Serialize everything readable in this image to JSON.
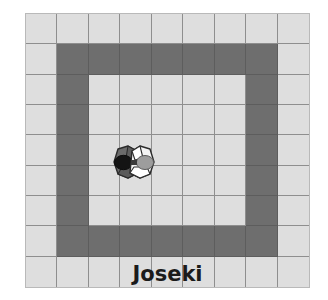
{
  "illustration": {
    "title": "Joseki",
    "caption": "Joseki"
  },
  "board": {
    "columns": 9,
    "rows": 9,
    "light_color": "#dedede",
    "dark_color": "#6e6e6e",
    "line_color": "#8e8e8e",
    "border_color": "#b9b9b9",
    "grid": [
      [
        "light",
        "light",
        "light",
        "light",
        "light",
        "light",
        "light",
        "light",
        "light"
      ],
      [
        "light",
        "dark",
        "dark",
        "dark",
        "dark",
        "dark",
        "dark",
        "dark",
        "light"
      ],
      [
        "light",
        "dark",
        "light",
        "light",
        "light",
        "light",
        "light",
        "dark",
        "light"
      ],
      [
        "light",
        "dark",
        "light",
        "light",
        "light",
        "light",
        "light",
        "dark",
        "light"
      ],
      [
        "light",
        "dark",
        "light",
        "light",
        "light",
        "light",
        "light",
        "dark",
        "light"
      ],
      [
        "light",
        "dark",
        "light",
        "light",
        "light",
        "light",
        "light",
        "dark",
        "light"
      ],
      [
        "light",
        "dark",
        "light",
        "light",
        "light",
        "light",
        "light",
        "dark",
        "light"
      ],
      [
        "light",
        "dark",
        "dark",
        "dark",
        "dark",
        "dark",
        "dark",
        "dark",
        "light"
      ],
      [
        "light",
        "light",
        "light",
        "light",
        "light",
        "light",
        "light",
        "light",
        "light"
      ]
    ]
  },
  "pieces": [
    {
      "name": "black-stone-figure",
      "side": "left",
      "body_color": "#6b6b6b",
      "accent_color": "#1a1a1a",
      "outline_color": "#2b2b2b"
    },
    {
      "name": "white-stone-figure",
      "side": "right",
      "body_color": "#f2f2f2",
      "accent_color": "#9a9a9a",
      "outline_color": "#2b2b2b"
    }
  ]
}
